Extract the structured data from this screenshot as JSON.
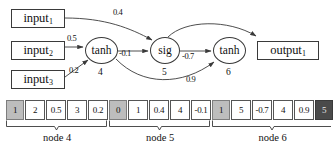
{
  "graph": {
    "inputs": [
      {
        "id": "input1",
        "label": "input",
        "subscript": "1"
      },
      {
        "id": "input2",
        "label": "input",
        "subscript": "2"
      },
      {
        "id": "input3",
        "label": "input",
        "subscript": "3"
      }
    ],
    "outputs": [
      {
        "id": "output1",
        "label": "output",
        "subscript": "1"
      }
    ],
    "nodes": [
      {
        "id": "node4",
        "activation": "tanh",
        "index": "4"
      },
      {
        "id": "node5",
        "activation": "sig",
        "index": "5"
      },
      {
        "id": "node6",
        "activation": "tanh",
        "index": "6"
      }
    ],
    "edges": [
      {
        "id": "e-input1-node5",
        "from": "input1",
        "to": "node5",
        "weight": "0.4"
      },
      {
        "id": "e-input2-node4",
        "from": "input2",
        "to": "node4",
        "weight": "0.5"
      },
      {
        "id": "e-input3-node4",
        "from": "input3",
        "to": "node4",
        "weight": "0.2"
      },
      {
        "id": "e-node4-node5",
        "from": "node4",
        "to": "node5",
        "weight": "-0.1"
      },
      {
        "id": "e-node5-node6",
        "from": "node5",
        "to": "node6",
        "weight": "-0.7"
      },
      {
        "id": "e-node4-node6",
        "from": "node4",
        "to": "node6",
        "weight": "0.9"
      },
      {
        "id": "e-node6-output1",
        "from": "node6",
        "to": "output1",
        "weight": ""
      }
    ]
  },
  "array": {
    "cells": [
      {
        "value": "1",
        "shade": "light"
      },
      {
        "value": "2",
        "shade": "none"
      },
      {
        "value": "0.5",
        "shade": "none"
      },
      {
        "value": "3",
        "shade": "none"
      },
      {
        "value": "0.2",
        "shade": "none"
      },
      {
        "value": "0",
        "shade": "light"
      },
      {
        "value": "1",
        "shade": "none"
      },
      {
        "value": "0.4",
        "shade": "none"
      },
      {
        "value": "4",
        "shade": "none"
      },
      {
        "value": "-0.1",
        "shade": "none"
      },
      {
        "value": "1",
        "shade": "light"
      },
      {
        "value": "5",
        "shade": "none"
      },
      {
        "value": "-0.7",
        "shade": "none"
      },
      {
        "value": "4",
        "shade": "none"
      },
      {
        "value": "0.9",
        "shade": "none"
      },
      {
        "value": "5",
        "shade": "dark"
      }
    ],
    "groups": [
      {
        "id": "group-node4",
        "label": "node 4",
        "start": 0,
        "end": 4
      },
      {
        "id": "group-node5",
        "label": "node 5",
        "start": 5,
        "end": 9
      },
      {
        "id": "group-node6",
        "label": "node 6",
        "start": 10,
        "end": 15
      }
    ]
  },
  "colors": {
    "stroke": "#3a3a3a",
    "cell_border": "#555555",
    "shade_light": "#bdbdbd",
    "shade_dark": "#4a4a4a",
    "background": "#ffffff"
  }
}
